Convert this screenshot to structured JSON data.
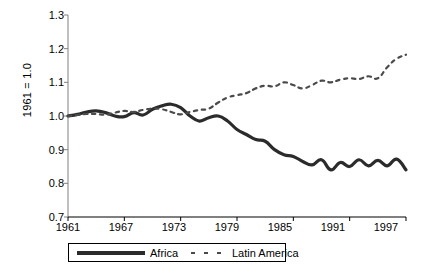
{
  "chart_data": {
    "type": "line",
    "title": "",
    "xlabel": "",
    "ylabel": "1961 = 1.0",
    "xlim": [
      1961,
      1997
    ],
    "ylim": [
      0.7,
      1.3
    ],
    "grid": false,
    "legend_position": "bottom",
    "yticks": [
      "1.3",
      "1.2",
      "1.1",
      "1.0",
      "0.9",
      "0.8",
      "0.7"
    ],
    "ytick_values": [
      1.3,
      1.2,
      1.1,
      1.0,
      0.9,
      0.8,
      0.7
    ],
    "xticks": [
      "1961",
      "1967",
      "1973",
      "1979",
      "1985",
      "1991",
      "1997"
    ],
    "xtick_values": [
      1961,
      1967,
      1973,
      1979,
      1985,
      1991,
      1997
    ],
    "x": [
      1961,
      1962,
      1963,
      1964,
      1965,
      1966,
      1967,
      1968,
      1969,
      1970,
      1971,
      1972,
      1973,
      1974,
      1975,
      1976,
      1977,
      1978,
      1979,
      1980,
      1981,
      1982,
      1983,
      1984,
      1985,
      1986,
      1987,
      1988,
      1989,
      1990,
      1991,
      1992,
      1993,
      1994,
      1995,
      1996,
      1997
    ],
    "series": [
      {
        "name": "Africa",
        "style": "solid",
        "color": "#2b2b2b",
        "width": 3.2,
        "values": [
          1.0,
          1.005,
          1.012,
          1.015,
          1.01,
          1.0,
          0.998,
          1.01,
          1.003,
          1.02,
          1.03,
          1.035,
          1.025,
          1.0,
          0.985,
          0.995,
          1.0,
          0.985,
          0.96,
          0.945,
          0.93,
          0.925,
          0.9,
          0.885,
          0.88,
          0.865,
          0.855,
          0.87,
          0.84,
          0.862,
          0.85,
          0.87,
          0.852,
          0.868,
          0.852,
          0.872,
          0.84
        ]
      },
      {
        "name": "Latin America",
        "style": "dashed",
        "color": "#4a4a4a",
        "width": 2.2,
        "values": [
          1.0,
          1.003,
          1.006,
          1.006,
          1.004,
          1.01,
          1.015,
          1.012,
          1.018,
          1.022,
          1.02,
          1.012,
          1.005,
          1.012,
          1.018,
          1.022,
          1.04,
          1.055,
          1.062,
          1.068,
          1.082,
          1.09,
          1.088,
          1.1,
          1.092,
          1.082,
          1.092,
          1.105,
          1.1,
          1.108,
          1.112,
          1.11,
          1.118,
          1.112,
          1.145,
          1.17,
          1.182
        ]
      }
    ]
  },
  "legend": {
    "items": [
      {
        "label": "Africa",
        "style": "solid"
      },
      {
        "label": "Latin America",
        "style": "dashed"
      }
    ]
  }
}
